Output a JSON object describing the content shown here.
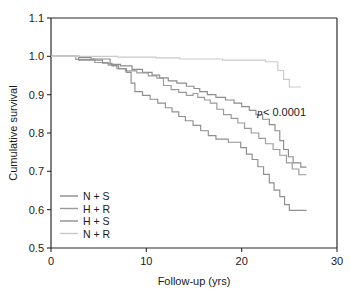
{
  "chart_data": {
    "type": "line",
    "title": "",
    "subtitle": "",
    "xlabel": "Follow-up (yrs)",
    "ylabel": "Cumulative survival",
    "xlim": [
      0,
      30
    ],
    "ylim": [
      0.5,
      1.1
    ],
    "xticks": [
      0,
      10,
      20,
      30
    ],
    "xtick_labels": [
      "0",
      "10",
      "20",
      "30"
    ],
    "yticks": [
      0.5,
      0.6,
      0.7,
      0.8,
      0.9,
      1.0,
      1.1
    ],
    "ytick_labels": [
      "0.5",
      "0.6",
      "0.7",
      "0.8",
      "0.9",
      "1.0",
      "1.1"
    ],
    "grid": false,
    "legend_position": "lower-left-inside",
    "step_type": "post",
    "annotations": [
      {
        "name": "p-value",
        "text_italic": "p",
        "text_rest": " < 0.0001",
        "x": 21.6,
        "y": 0.845
      }
    ],
    "series": [
      {
        "name": "N + S",
        "label": "N + S",
        "color": "#8c8c8c",
        "points": [
          [
            0.0,
            1.0
          ],
          [
            3.0,
            1.0
          ],
          [
            3.0,
            0.997
          ],
          [
            4.2,
            0.997
          ],
          [
            4.2,
            0.993
          ],
          [
            6.2,
            0.993
          ],
          [
            6.2,
            0.979
          ],
          [
            7.3,
            0.979
          ],
          [
            7.3,
            0.975
          ],
          [
            8.5,
            0.975
          ],
          [
            8.5,
            0.966
          ],
          [
            9.6,
            0.966
          ],
          [
            9.6,
            0.958
          ],
          [
            10.6,
            0.958
          ],
          [
            10.6,
            0.951
          ],
          [
            11.4,
            0.951
          ],
          [
            11.4,
            0.944
          ],
          [
            12.3,
            0.944
          ],
          [
            12.3,
            0.936
          ],
          [
            13.2,
            0.936
          ],
          [
            13.2,
            0.93
          ],
          [
            14.2,
            0.93
          ],
          [
            14.2,
            0.922
          ],
          [
            15.0,
            0.922
          ],
          [
            15.0,
            0.916
          ],
          [
            15.6,
            0.916
          ],
          [
            15.6,
            0.908
          ],
          [
            16.4,
            0.908
          ],
          [
            16.4,
            0.9
          ],
          [
            17.3,
            0.9
          ],
          [
            17.3,
            0.893
          ],
          [
            18.3,
            0.893
          ],
          [
            18.3,
            0.886
          ],
          [
            19.2,
            0.886
          ],
          [
            19.2,
            0.878
          ],
          [
            20.0,
            0.878
          ],
          [
            20.0,
            0.869
          ],
          [
            20.8,
            0.869
          ],
          [
            20.8,
            0.859
          ],
          [
            21.5,
            0.859
          ],
          [
            21.5,
            0.848
          ],
          [
            22.2,
            0.848
          ],
          [
            22.2,
            0.836
          ],
          [
            22.9,
            0.836
          ],
          [
            22.9,
            0.822
          ],
          [
            23.5,
            0.822
          ],
          [
            23.5,
            0.806
          ],
          [
            24.0,
            0.806
          ],
          [
            24.0,
            0.78
          ],
          [
            24.4,
            0.78
          ],
          [
            24.4,
            0.757
          ],
          [
            24.9,
            0.757
          ],
          [
            24.9,
            0.738
          ],
          [
            25.4,
            0.738
          ],
          [
            25.4,
            0.722
          ],
          [
            26.2,
            0.722
          ],
          [
            26.2,
            0.711
          ],
          [
            26.8,
            0.711
          ]
        ],
        "final_value": 0.711
      },
      {
        "name": "H + R",
        "label": "H + R",
        "color": "#9a9a9a",
        "points": [
          [
            0.0,
            1.0
          ],
          [
            2.6,
            1.0
          ],
          [
            2.6,
            0.992
          ],
          [
            4.6,
            0.992
          ],
          [
            4.6,
            0.984
          ],
          [
            6.0,
            0.984
          ],
          [
            6.0,
            0.977
          ],
          [
            6.9,
            0.977
          ],
          [
            6.9,
            0.968
          ],
          [
            7.8,
            0.968
          ],
          [
            7.8,
            0.962
          ],
          [
            9.0,
            0.962
          ],
          [
            9.0,
            0.957
          ],
          [
            10.2,
            0.957
          ],
          [
            10.2,
            0.949
          ],
          [
            11.1,
            0.949
          ],
          [
            11.1,
            0.943
          ],
          [
            11.8,
            0.943
          ],
          [
            11.8,
            0.924
          ],
          [
            12.6,
            0.924
          ],
          [
            12.6,
            0.913
          ],
          [
            13.4,
            0.913
          ],
          [
            13.4,
            0.906
          ],
          [
            14.2,
            0.906
          ],
          [
            14.2,
            0.898
          ],
          [
            14.9,
            0.898
          ],
          [
            14.9,
            0.903
          ],
          [
            15.4,
            0.903
          ],
          [
            15.4,
            0.893
          ],
          [
            16.1,
            0.893
          ],
          [
            16.1,
            0.886
          ],
          [
            16.7,
            0.886
          ],
          [
            16.7,
            0.878
          ],
          [
            17.4,
            0.878
          ],
          [
            17.4,
            0.862
          ],
          [
            18.1,
            0.862
          ],
          [
            18.1,
            0.848
          ],
          [
            18.9,
            0.848
          ],
          [
            18.9,
            0.838
          ],
          [
            19.6,
            0.838
          ],
          [
            19.6,
            0.826
          ],
          [
            20.3,
            0.826
          ],
          [
            20.3,
            0.812
          ],
          [
            21.0,
            0.812
          ],
          [
            21.0,
            0.8
          ],
          [
            21.8,
            0.8
          ],
          [
            21.8,
            0.786
          ],
          [
            22.5,
            0.786
          ],
          [
            22.5,
            0.772
          ],
          [
            23.3,
            0.772
          ],
          [
            23.3,
            0.757
          ],
          [
            24.0,
            0.757
          ],
          [
            24.0,
            0.742
          ],
          [
            24.7,
            0.742
          ],
          [
            24.7,
            0.722
          ],
          [
            25.3,
            0.722
          ],
          [
            25.3,
            0.706
          ],
          [
            26.0,
            0.706
          ],
          [
            26.0,
            0.691
          ],
          [
            26.8,
            0.691
          ]
        ],
        "final_value": 0.691
      },
      {
        "name": "H + S",
        "label": "H + S",
        "color": "#8f8f8f",
        "points": [
          [
            0.0,
            1.0
          ],
          [
            2.9,
            1.0
          ],
          [
            2.9,
            0.99
          ],
          [
            5.4,
            0.99
          ],
          [
            5.4,
            0.982
          ],
          [
            6.4,
            0.982
          ],
          [
            6.4,
            0.975
          ],
          [
            7.1,
            0.975
          ],
          [
            7.1,
            0.968
          ],
          [
            7.9,
            0.968
          ],
          [
            7.9,
            0.958
          ],
          [
            8.4,
            0.958
          ],
          [
            8.4,
            0.93
          ],
          [
            8.8,
            0.93
          ],
          [
            8.8,
            0.908
          ],
          [
            9.6,
            0.908
          ],
          [
            9.6,
            0.898
          ],
          [
            10.4,
            0.898
          ],
          [
            10.4,
            0.888
          ],
          [
            11.2,
            0.888
          ],
          [
            11.2,
            0.878
          ],
          [
            12.0,
            0.878
          ],
          [
            12.0,
            0.866
          ],
          [
            12.7,
            0.866
          ],
          [
            12.7,
            0.855
          ],
          [
            13.4,
            0.855
          ],
          [
            13.4,
            0.843
          ],
          [
            14.1,
            0.843
          ],
          [
            14.1,
            0.832
          ],
          [
            14.9,
            0.832
          ],
          [
            14.9,
            0.82
          ],
          [
            15.7,
            0.82
          ],
          [
            15.7,
            0.806
          ],
          [
            16.5,
            0.806
          ],
          [
            16.5,
            0.793
          ],
          [
            17.3,
            0.793
          ],
          [
            17.3,
            0.784
          ],
          [
            18.6,
            0.784
          ],
          [
            18.6,
            0.776
          ],
          [
            19.9,
            0.776
          ],
          [
            19.9,
            0.762
          ],
          [
            20.5,
            0.762
          ],
          [
            20.5,
            0.745
          ],
          [
            21.1,
            0.745
          ],
          [
            21.1,
            0.731
          ],
          [
            21.7,
            0.731
          ],
          [
            21.7,
            0.712
          ],
          [
            22.3,
            0.712
          ],
          [
            22.3,
            0.692
          ],
          [
            22.9,
            0.692
          ],
          [
            22.9,
            0.67
          ],
          [
            23.4,
            0.67
          ],
          [
            23.4,
            0.651
          ],
          [
            24.0,
            0.651
          ],
          [
            24.0,
            0.634
          ],
          [
            24.5,
            0.634
          ],
          [
            24.5,
            0.613
          ],
          [
            25.0,
            0.613
          ],
          [
            25.0,
            0.598
          ],
          [
            26.8,
            0.598
          ]
        ],
        "final_value": 0.598
      },
      {
        "name": "N + R",
        "label": "N + R",
        "color": "#c9c9c9",
        "points": [
          [
            0.0,
            1.0
          ],
          [
            7.0,
            1.0
          ],
          [
            7.0,
            0.998
          ],
          [
            11.0,
            0.998
          ],
          [
            11.0,
            0.996
          ],
          [
            13.5,
            0.996
          ],
          [
            13.5,
            0.993
          ],
          [
            18.0,
            0.993
          ],
          [
            18.0,
            0.99
          ],
          [
            22.5,
            0.99
          ],
          [
            22.5,
            0.986
          ],
          [
            23.8,
            0.986
          ],
          [
            23.8,
            0.963
          ],
          [
            24.4,
            0.963
          ],
          [
            24.4,
            0.94
          ],
          [
            25.0,
            0.94
          ],
          [
            25.0,
            0.92
          ],
          [
            26.2,
            0.92
          ]
        ],
        "final_value": 0.92
      }
    ]
  },
  "legend": {
    "entries": [
      {
        "label": "N + S",
        "color": "#8c8c8c"
      },
      {
        "label": "H + R",
        "color": "#9a9a9a"
      },
      {
        "label": "H + S",
        "color": "#8f8f8f"
      },
      {
        "label": "N + R",
        "color": "#c9c9c9"
      }
    ]
  },
  "axes": {
    "x_title": "Follow-up (yrs)",
    "y_title": "Cumulative survival",
    "x_tick_labels": [
      "0",
      "10",
      "20",
      "30"
    ],
    "y_tick_labels": [
      "1.1",
      "1.0",
      "0.9",
      "0.8",
      "0.7",
      "0.6",
      "0.5"
    ]
  },
  "annotation": {
    "p_symbol": "p",
    "p_text": " < 0.0001"
  },
  "colors": {
    "axis": "#2b2b2b",
    "background": "#ffffff",
    "text": "#1a1a1a"
  }
}
